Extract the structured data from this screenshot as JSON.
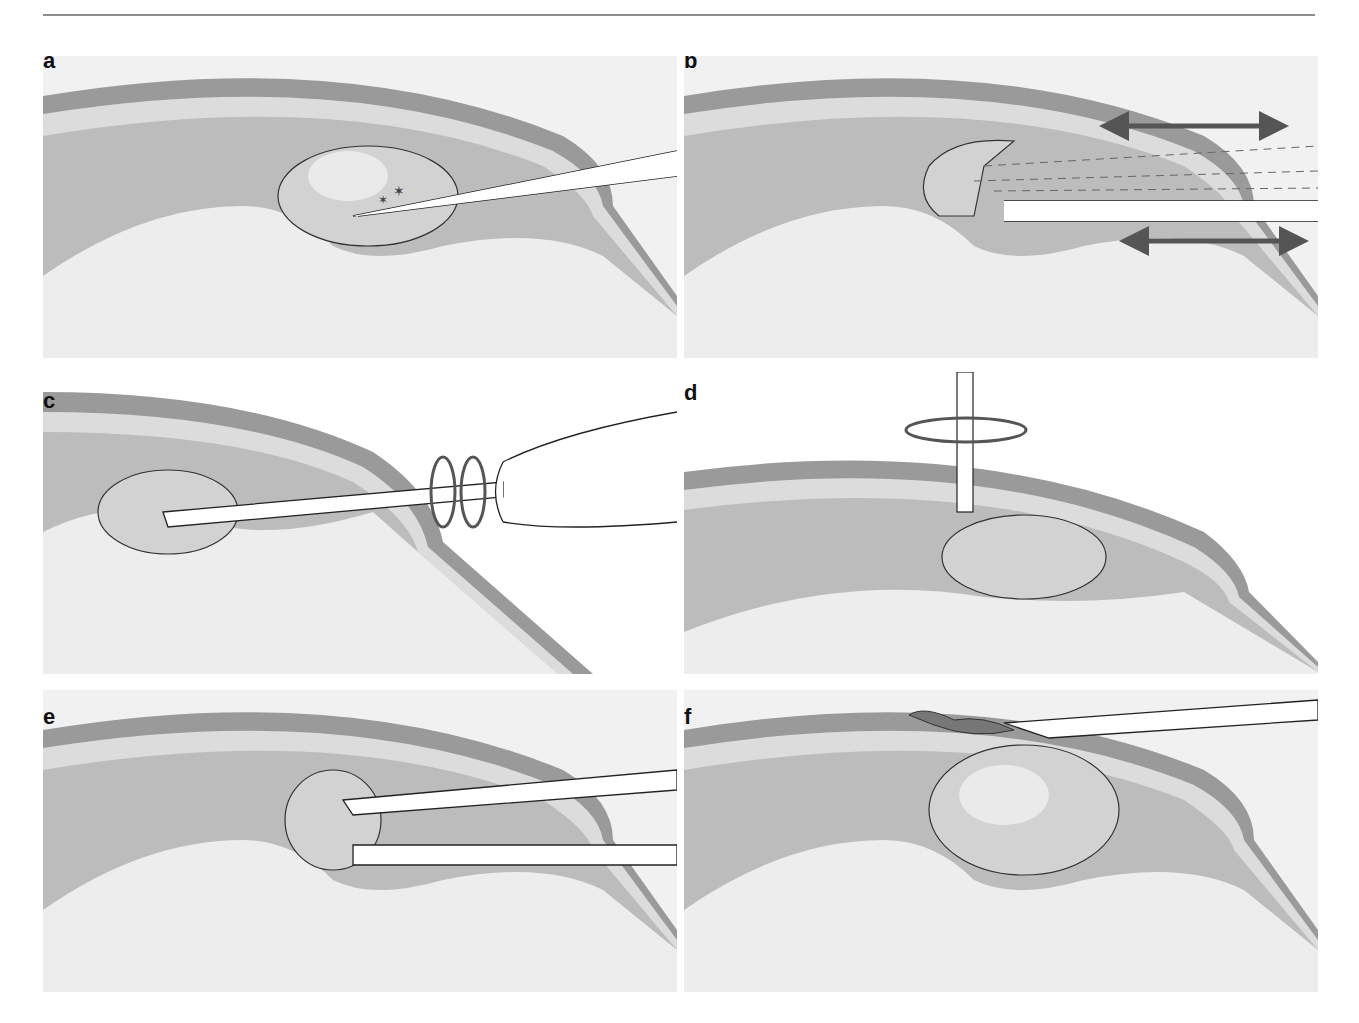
{
  "figure": {
    "header_text": "",
    "panels": [
      {
        "label": "a",
        "description": "Needle tip inserted into nucleus; small star-shaped fragments near tip"
      },
      {
        "label": "b",
        "description": "Nucleus fragmented with star and circle particles; dashed lines and instrument with bidirectional arrows"
      },
      {
        "label": "c",
        "description": "Needle inserted into nucleus, rotated between fingers with circular arrows"
      },
      {
        "label": "d",
        "description": "Vertical instrument splitting nucleus in two halves with rotation arrow"
      },
      {
        "label": "e",
        "description": "Forceps-like instrument grasping fragmented nucleus with curved arrows"
      },
      {
        "label": "f",
        "description": "Intact nucleus; instrument at surface removing small dark fragment"
      }
    ]
  },
  "colors": {
    "outer_band": "#9a9a9a",
    "light_band": "#d8d8d8",
    "mid_layer": "#bdbdbd",
    "inner_bg": "#ececec",
    "nucleus": "#c8c8c8",
    "arrow": "#555555",
    "line": "#222222"
  }
}
